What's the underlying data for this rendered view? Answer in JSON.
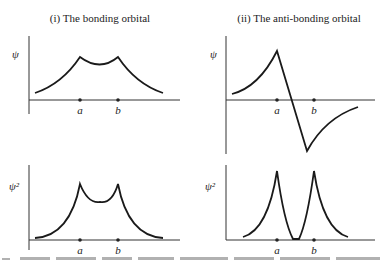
{
  "figure": {
    "panels": [
      {
        "title": "(i) The bonding orbital",
        "top": {
          "ylabel": "ψ",
          "xticks": [
            "a",
            "b"
          ]
        },
        "bottom": {
          "ylabel": "ψ²",
          "xticks": [
            "a",
            "b"
          ]
        }
      },
      {
        "title": "(ii) The anti-bonding orbital",
        "top": {
          "ylabel": "ψ",
          "xticks": [
            "a",
            "b"
          ]
        },
        "bottom": {
          "ylabel": "ψ²",
          "xticks": [
            "a",
            "b"
          ]
        }
      }
    ],
    "caption_partial": "..."
  }
}
